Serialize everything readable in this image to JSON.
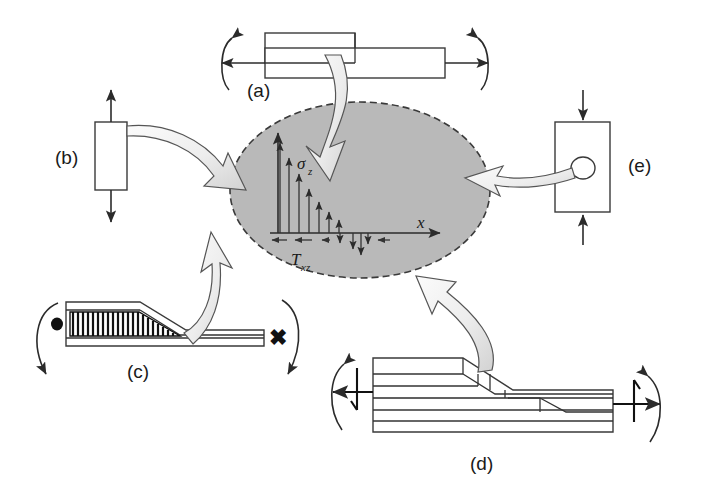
{
  "figure": {
    "background_color": "#ffffff",
    "width": 702,
    "height": 492
  },
  "center": {
    "name": "interlaminar-stress-state",
    "shape": "ellipse",
    "fill_color": "#b9b9b9",
    "border_color": "#3a3a3a",
    "border_style": "dashed",
    "cx": 360,
    "cy": 190,
    "rx": 130,
    "ry": 88,
    "axes": {
      "x_label": "x",
      "z_label": "σ",
      "z_label_sub": "z",
      "shear_label": "T",
      "shear_label_sub": "xz",
      "origin_x": 278,
      "origin_y": 233,
      "x_axis_end": 440,
      "z_axis_top": 133
    },
    "sigma_z_profile": {
      "description": "normal stress sigma_z decaying with distance x from free edge",
      "x_offsets": [
        2,
        11,
        21,
        31,
        41,
        51,
        61
      ],
      "heights": [
        95,
        78,
        61,
        46,
        33,
        22,
        14
      ],
      "arrow_direction": "up"
    },
    "tau_xz_profile": {
      "description": "interlaminar shear stress tau_xz, self-equilibrating along x",
      "down_arrow_x_offsets": [
        62,
        75,
        83,
        90
      ],
      "down_arrow_heights": [
        10,
        16,
        22,
        11
      ],
      "side_tick_x_offsets": [
        -8,
        8,
        26,
        100
      ],
      "arrow_direction": "down-and-inward"
    }
  },
  "panels": [
    {
      "id": "a",
      "label": "(a)",
      "name": "panel-a-lap-joint",
      "description": "Offset lap joint loaded in tension with eccentric-load moments at both ends",
      "features": [
        "upper-bar",
        "lower-bar",
        "left-axial-arrow",
        "right-axial-arrow",
        "left-moment-arc",
        "right-moment-arc"
      ]
    },
    {
      "id": "b",
      "label": "(b)",
      "name": "panel-b-tension-coupon",
      "description": "Straight-sided coupon loaded in uniaxial tension",
      "features": [
        "rectangular-coupon",
        "top-tension-arrow",
        "bottom-tension-arrow"
      ]
    },
    {
      "id": "c",
      "label": "(c)",
      "name": "panel-c-tapered-laminate",
      "description": "Tapered laminate with ply drop-offs, built-in at left, loaded at free end",
      "features": [
        "hatched-taper-region",
        "fixed-support-dot",
        "left-curved-arrow",
        "right-curved-arrow",
        "cross-marker"
      ],
      "cross_marker": "✖"
    },
    {
      "id": "d",
      "label": "(d)",
      "name": "panel-d-stepped-laminate",
      "description": "Internally stepped / ply-drop laminate under combined axial load and bending",
      "features": [
        "layered-stack",
        "stepped-ply-terminations",
        "left-force-moment-symbol",
        "right-force-moment-symbol"
      ]
    },
    {
      "id": "e",
      "label": "(e)",
      "name": "panel-e-plate-with-hole",
      "description": "Plate containing an open hole loaded in compression",
      "features": [
        "rectangular-plate",
        "circular-hole",
        "top-compression-arrow",
        "bottom-compression-arrow"
      ]
    }
  ],
  "connectors": [
    {
      "name": "connector-a-to-center",
      "from": "a",
      "to": "center",
      "style": "curved-block-arrow"
    },
    {
      "name": "connector-b-to-center",
      "from": "b",
      "to": "center",
      "style": "curved-block-arrow"
    },
    {
      "name": "connector-c-to-center",
      "from": "c",
      "to": "center",
      "style": "curved-block-arrow"
    },
    {
      "name": "connector-d-to-center",
      "from": "d",
      "to": "center",
      "style": "curved-block-arrow"
    },
    {
      "name": "connector-e-to-center",
      "from": "e",
      "to": "center",
      "style": "curved-block-arrow"
    }
  ]
}
